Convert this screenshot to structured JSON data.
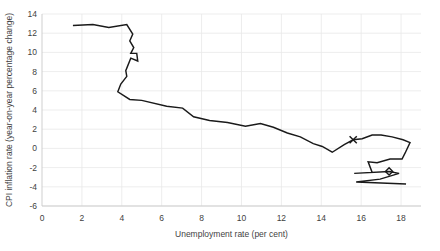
{
  "chart_data": {
    "type": "line",
    "title": "",
    "subtitle": "",
    "xlabel": "Unemployment rate (per cent)",
    "ylabel": "CPI inflation rate (year-on-year percentage change)",
    "xlim": [
      0,
      19
    ],
    "ylim": [
      -6,
      14
    ],
    "xticks": [
      0,
      2,
      4,
      6,
      8,
      10,
      12,
      14,
      16,
      18
    ],
    "yticks": [
      -6,
      -4,
      -2,
      0,
      2,
      4,
      6,
      8,
      10,
      12,
      14
    ],
    "xtick_labels": [
      "0",
      "2",
      "4",
      "6",
      "8",
      "10",
      "12",
      "14",
      "16",
      "18"
    ],
    "ytick_labels": [
      "-6",
      "-4",
      "-2",
      "0",
      "2",
      "4",
      "6",
      "8",
      "10",
      "12",
      "14"
    ],
    "grid": true,
    "legend": "none",
    "line_color": "#1a1a1a",
    "grid_color": "#e8e8e8",
    "axis_color": "#c9c9c9",
    "series": [
      {
        "name": "Phillips curve path",
        "points": [
          [
            1.55,
            12.8
          ],
          [
            2.55,
            12.9
          ],
          [
            3.35,
            12.6
          ],
          [
            4.25,
            12.9
          ],
          [
            4.55,
            11.9
          ],
          [
            4.4,
            11.2
          ],
          [
            4.6,
            10.5
          ],
          [
            4.45,
            9.9
          ],
          [
            4.75,
            9.9
          ],
          [
            4.8,
            9.1
          ],
          [
            4.45,
            9.4
          ],
          [
            4.2,
            8.1
          ],
          [
            4.25,
            7.5
          ],
          [
            3.95,
            6.7
          ],
          [
            3.8,
            5.9
          ],
          [
            4.4,
            5.1
          ],
          [
            5.0,
            5.0
          ],
          [
            6.25,
            4.4
          ],
          [
            7.05,
            4.2
          ],
          [
            7.6,
            3.3
          ],
          [
            8.4,
            2.9
          ],
          [
            9.3,
            2.7
          ],
          [
            10.2,
            2.3
          ],
          [
            10.95,
            2.6
          ],
          [
            11.6,
            2.2
          ],
          [
            12.3,
            1.6
          ],
          [
            12.95,
            1.2
          ],
          [
            13.6,
            0.5
          ],
          [
            14.05,
            0.2
          ],
          [
            14.55,
            -0.4
          ],
          [
            15.15,
            0.4
          ],
          [
            15.6,
            0.9
          ],
          [
            16.05,
            1.0
          ],
          [
            16.55,
            1.4
          ],
          [
            17.0,
            1.4
          ],
          [
            17.55,
            1.2
          ],
          [
            18.1,
            0.9
          ],
          [
            18.45,
            0.6
          ],
          [
            18.2,
            -0.5
          ],
          [
            18.05,
            -1.1
          ],
          [
            17.45,
            -1.1
          ],
          [
            16.8,
            -1.5
          ],
          [
            16.35,
            -1.4
          ],
          [
            16.55,
            -2.5
          ],
          [
            15.65,
            -2.6
          ],
          [
            17.4,
            -2.4
          ],
          [
            17.9,
            -2.6
          ],
          [
            16.95,
            -3.2
          ],
          [
            15.75,
            -3.5
          ],
          [
            18.25,
            -3.7
          ]
        ]
      }
    ],
    "markers": [
      {
        "shape": "x",
        "x": 15.6,
        "y": 0.9,
        "name": "x-marker"
      },
      {
        "shape": "diamond",
        "x": 17.4,
        "y": -2.4,
        "name": "diamond-marker"
      }
    ]
  }
}
